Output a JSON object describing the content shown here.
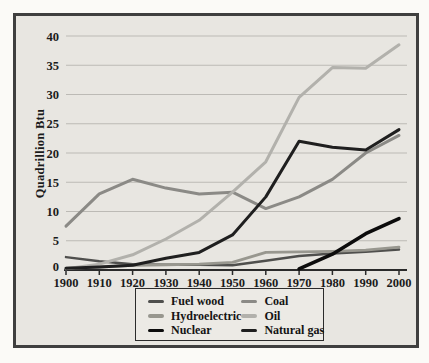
{
  "figure": {
    "outer_background": "#fbfaf7",
    "frame_background": "#e8e6e1",
    "frame_border_color": "#3f3f3f",
    "grid_color": "#bcbab5",
    "axis_color": "#2a2a2a",
    "tick_label_color": "#1b1b1b"
  },
  "chart_data": {
    "type": "line",
    "title": "",
    "xlabel": "",
    "ylabel": "Quadrillion Btu",
    "ylim": [
      0,
      40
    ],
    "ytick_step": 5,
    "grid": true,
    "x": [
      1900,
      1910,
      1920,
      1930,
      1940,
      1950,
      1960,
      1970,
      1980,
      1990,
      2000
    ],
    "series": [
      {
        "name": "Fuel wood",
        "key": "fuel-wood",
        "color": "#4f4f4d",
        "width": 2.5,
        "values": [
          2.2,
          1.5,
          1.0,
          0.9,
          0.9,
          0.8,
          1.6,
          2.4,
          2.8,
          3.1,
          3.5
        ]
      },
      {
        "name": "Hydroelectric",
        "key": "hydroelectric",
        "color": "#98978f",
        "width": 2.8,
        "values": [
          0.3,
          0.5,
          0.8,
          0.9,
          1.0,
          1.3,
          3.0,
          3.1,
          3.2,
          3.4,
          3.9
        ]
      },
      {
        "name": "Coal",
        "key": "coal",
        "color": "#8b8a86",
        "width": 3,
        "values": [
          7.5,
          13.0,
          15.5,
          14.0,
          13.0,
          13.3,
          10.5,
          12.5,
          15.5,
          20.0,
          23.0
        ]
      },
      {
        "name": "Oil",
        "key": "oil",
        "color": "#b2b1ac",
        "width": 3,
        "values": [
          0.2,
          1.0,
          2.6,
          5.3,
          8.5,
          13.3,
          18.5,
          29.5,
          34.6,
          34.5,
          38.5
        ]
      },
      {
        "name": "Natural gas",
        "key": "natural-gas",
        "color": "#1f1f1f",
        "width": 3,
        "values": [
          0.3,
          0.5,
          0.8,
          2.0,
          3.0,
          6.0,
          12.5,
          22.0,
          21.0,
          20.5,
          24.0
        ]
      },
      {
        "name": "Nuclear",
        "key": "nuclear",
        "color": "#0c0c0c",
        "width": 3.6,
        "values": [
          null,
          null,
          null,
          null,
          null,
          null,
          null,
          0.2,
          2.7,
          6.2,
          8.8
        ]
      }
    ],
    "legend": {
      "position": "bottom",
      "columns": [
        [
          "Fuel wood",
          "Hydroelectric",
          "Nuclear"
        ],
        [
          "Coal",
          "Oil",
          "Natural gas"
        ]
      ]
    }
  }
}
